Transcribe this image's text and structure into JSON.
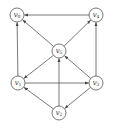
{
  "diagram": {
    "type": "directed-graph",
    "colors": {
      "stroke": "#555555",
      "label": "#333333",
      "background": "#ffffff"
    },
    "node_radius": 7,
    "nodes": [
      {
        "id": "v0",
        "label": "v",
        "sub": "0",
        "x": 17,
        "y": 15
      },
      {
        "id": "v4",
        "label": "v",
        "sub": "4",
        "x": 96,
        "y": 15
      },
      {
        "id": "v5",
        "label": "v",
        "sub": "5",
        "x": 59,
        "y": 51
      },
      {
        "id": "v1",
        "label": "v",
        "sub": "1",
        "x": 18,
        "y": 83
      },
      {
        "id": "v3",
        "label": "v",
        "sub": "3",
        "x": 96,
        "y": 83
      },
      {
        "id": "v2",
        "label": "v",
        "sub": "2",
        "x": 59,
        "y": 113
      }
    ],
    "edges": [
      {
        "from": "v1",
        "to": "v0"
      },
      {
        "from": "v5",
        "to": "v0"
      },
      {
        "from": "v4",
        "to": "v0"
      },
      {
        "from": "v5",
        "to": "v4"
      },
      {
        "from": "v3",
        "to": "v4"
      },
      {
        "from": "v5",
        "to": "v1"
      },
      {
        "from": "v3",
        "to": "v5"
      },
      {
        "from": "v2",
        "to": "v5"
      },
      {
        "from": "v1",
        "to": "v3"
      },
      {
        "from": "v2",
        "to": "v1"
      },
      {
        "from": "v3",
        "to": "v2"
      }
    ]
  }
}
